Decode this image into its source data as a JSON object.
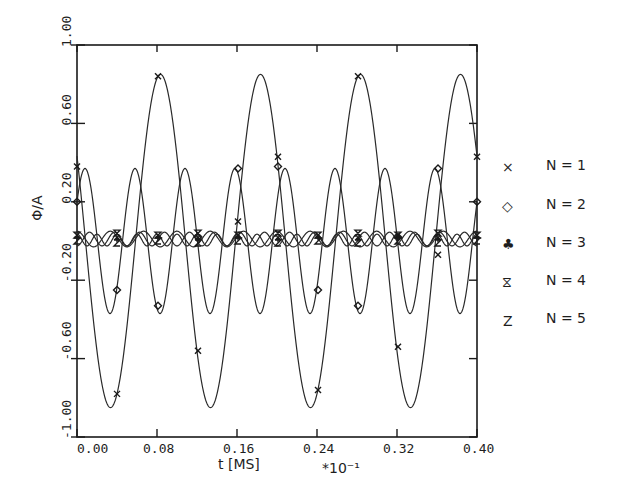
{
  "chart_data": {
    "type": "line",
    "title": "",
    "xlabel": "t [MS]",
    "xlabel_multiplier": "*10⁻¹",
    "ylabel": "Φ/A",
    "xlim": [
      0.0,
      0.4
    ],
    "ylim": [
      -1.0,
      1.0
    ],
    "xticks": [
      "0.00",
      "0.08",
      "0.16",
      "0.24",
      "0.32",
      "0.40"
    ],
    "xtick_values": [
      0.0,
      0.08,
      0.16,
      0.24,
      0.32,
      0.4
    ],
    "yticks": [
      "1.00",
      "0.60",
      "0.20",
      "-0.20",
      "-0.60",
      "-1.00"
    ],
    "ytick_values": [
      1.0,
      0.6,
      0.2,
      -0.2,
      -0.6,
      -1.0
    ],
    "grid": false,
    "legend_position": "right",
    "x": [
      0.0,
      0.01,
      0.02,
      0.03,
      0.04,
      0.05,
      0.06,
      0.07,
      0.08,
      0.09,
      0.1,
      0.11,
      0.12,
      0.13,
      0.14,
      0.15,
      0.16,
      0.17,
      0.18,
      0.19,
      0.2,
      0.21,
      0.22,
      0.23,
      0.24,
      0.25,
      0.26,
      0.27,
      0.28,
      0.29,
      0.3,
      0.31,
      0.32,
      0.33,
      0.34,
      0.35,
      0.36,
      0.37,
      0.38,
      0.39,
      0.4
    ],
    "series": [
      {
        "name": "N = 1",
        "marker": "x",
        "model": {
          "amplitude": 0.85,
          "period": 0.1,
          "peak_t": 0.0835,
          "offset": 0.0
        },
        "values": [
          0.42,
          -0.18,
          -0.68,
          -0.84,
          -0.55,
          0.04,
          0.6,
          0.85,
          0.77,
          0.3,
          -0.31,
          -0.77,
          -0.85,
          -0.59,
          -0.04,
          0.55,
          0.84,
          0.69,
          0.19,
          -0.42,
          -0.81,
          -0.81,
          -0.43,
          0.17,
          0.68,
          0.85,
          0.61,
          0.07,
          -0.52,
          -0.84,
          -0.77,
          -0.3,
          0.31,
          0.77,
          0.85,
          0.56,
          -0.04,
          -0.6,
          -0.85,
          -0.66,
          -0.15
        ],
        "marker_points": [
          [
            0.0,
            0.38
          ],
          [
            0.04,
            -0.78
          ],
          [
            0.081,
            0.84
          ],
          [
            0.121,
            -0.56
          ],
          [
            0.161,
            0.1
          ],
          [
            0.201,
            0.43
          ],
          [
            0.241,
            -0.76
          ],
          [
            0.281,
            0.84
          ],
          [
            0.321,
            -0.54
          ],
          [
            0.361,
            -0.07
          ],
          [
            0.4,
            0.43
          ]
        ]
      },
      {
        "name": "N = 2",
        "marker": "diamond",
        "model": {
          "amplitude": 0.37,
          "period": 0.05,
          "peak_t": 0.008,
          "offset": 0.0
        },
        "values": [
          0.35,
          0.01,
          -0.33,
          0.15,
          0.27,
          -0.26,
          -0.23,
          0.29,
          0.14,
          -0.33,
          0.0,
          0.33,
          -0.14,
          -0.29,
          0.23,
          0.26,
          -0.27,
          -0.15,
          0.33,
          0.01,
          -0.35,
          0.13,
          0.31,
          -0.24,
          -0.25,
          0.28,
          0.12,
          -0.31,
          0.0,
          0.34,
          -0.16,
          -0.28,
          0.24,
          0.26,
          -0.29,
          -0.13,
          0.33,
          0.0,
          -0.34,
          0.14,
          0.28
        ],
        "marker_points": [
          [
            0.0,
            0.2
          ],
          [
            0.04,
            -0.25
          ],
          [
            0.081,
            -0.33
          ],
          [
            0.121,
            0.02
          ],
          [
            0.161,
            0.37
          ],
          [
            0.201,
            0.38
          ],
          [
            0.241,
            -0.25
          ],
          [
            0.281,
            -0.33
          ],
          [
            0.321,
            0.02
          ],
          [
            0.361,
            0.37
          ],
          [
            0.4,
            0.2
          ]
        ]
      },
      {
        "name": "N = 3",
        "marker": "club",
        "model": {
          "amplitude": 0.04,
          "period": 0.0333,
          "peak_t": 0.0,
          "offset": 0.01
        },
        "values": [
          0.05,
          -0.02,
          -0.01,
          0.05,
          -0.02,
          -0.01,
          0.05,
          -0.02,
          -0.01,
          0.05,
          -0.02,
          -0.01,
          0.05,
          -0.02,
          -0.01,
          0.05,
          -0.02,
          -0.01,
          0.05,
          -0.02,
          -0.01,
          0.05,
          -0.02,
          -0.01,
          0.05,
          -0.02,
          -0.01,
          0.05,
          -0.02,
          -0.01,
          0.05,
          -0.02,
          -0.01,
          0.05,
          -0.02,
          -0.01,
          0.05,
          -0.02,
          -0.01,
          0.05,
          -0.02
        ],
        "marker_points": [
          [
            0.0,
            0.02
          ],
          [
            0.04,
            0.01
          ],
          [
            0.081,
            0.02
          ],
          [
            0.121,
            0.01
          ],
          [
            0.161,
            0.02
          ],
          [
            0.201,
            0.01
          ],
          [
            0.241,
            0.02
          ],
          [
            0.281,
            0.01
          ],
          [
            0.321,
            0.02
          ],
          [
            0.361,
            0.01
          ],
          [
            0.4,
            0.02
          ]
        ]
      },
      {
        "name": "N = 4",
        "marker": "hourglass",
        "model": {
          "amplitude": 0.035,
          "period": 0.025,
          "peak_t": 0.0125,
          "offset": 0.01
        },
        "values": [
          -0.025,
          0.0,
          0.035,
          0.0,
          -0.025,
          0.0,
          0.035,
          0.0,
          -0.025,
          0.0,
          0.035,
          0.0,
          -0.025,
          0.0,
          0.035,
          0.0,
          -0.025,
          0.0,
          0.035,
          0.0,
          -0.025,
          0.0,
          0.035,
          0.0,
          -0.025,
          0.0,
          0.035,
          0.0,
          -0.025,
          0.0,
          0.035,
          0.0,
          -0.025,
          0.0,
          0.035,
          0.0,
          -0.025,
          0.0,
          0.035,
          0.0,
          -0.025
        ],
        "marker_points": [
          [
            0.0,
            0.03
          ],
          [
            0.04,
            0.04
          ],
          [
            0.081,
            0.03
          ],
          [
            0.121,
            0.04
          ],
          [
            0.161,
            0.03
          ],
          [
            0.201,
            0.04
          ],
          [
            0.241,
            0.03
          ],
          [
            0.281,
            0.04
          ],
          [
            0.321,
            0.03
          ],
          [
            0.361,
            0.04
          ],
          [
            0.4,
            0.03
          ]
        ]
      },
      {
        "name": "N = 5",
        "marker": "Z",
        "model": {
          "amplitude": 0.03,
          "period": 0.02,
          "peak_t": 0.0,
          "offset": 0.005
        },
        "values": [
          0.035,
          0.035,
          0.035,
          0.035,
          0.035,
          0.035,
          0.035,
          0.035,
          0.035,
          0.035,
          0.035,
          0.035,
          0.035,
          0.035,
          0.035,
          0.035,
          0.035,
          0.035,
          0.035,
          0.035,
          0.035,
          0.035,
          0.035,
          0.035,
          0.035,
          0.035,
          0.035,
          0.035,
          0.035,
          0.035,
          0.035,
          0.035,
          0.035,
          0.035,
          0.035,
          0.035,
          0.035,
          0.035,
          0.035,
          0.035,
          0.035
        ],
        "marker_points": [
          [
            0.0,
            0.0
          ],
          [
            0.04,
            -0.01
          ],
          [
            0.081,
            0.0
          ],
          [
            0.121,
            -0.01
          ],
          [
            0.161,
            0.0
          ],
          [
            0.201,
            -0.01
          ],
          [
            0.241,
            0.0
          ],
          [
            0.281,
            -0.01
          ],
          [
            0.321,
            0.0
          ],
          [
            0.361,
            -0.01
          ],
          [
            0.4,
            0.0
          ]
        ]
      }
    ]
  },
  "legend": {
    "items": [
      {
        "symbol": "×",
        "label": "N = 1"
      },
      {
        "symbol": "◇",
        "label": "N = 2"
      },
      {
        "symbol": "♣",
        "label": "N = 3"
      },
      {
        "symbol": "⧖",
        "label": "N = 4"
      },
      {
        "symbol": "Z",
        "label": "N = 5"
      }
    ]
  },
  "colors": {
    "ink": "#1e1e1e",
    "background": "#ffffff"
  }
}
